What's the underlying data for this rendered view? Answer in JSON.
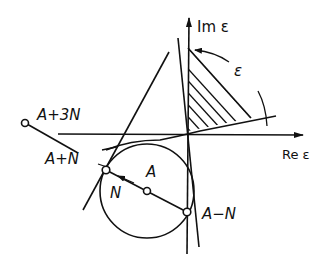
{
  "figure": {
    "axes": {
      "y_label": "Im ε",
      "x_label": "Re ε"
    },
    "points": {
      "center": "A",
      "plus_n": "A+N",
      "plus_3n": "A+3N",
      "minus_n": "A−N"
    },
    "vector_label": "N",
    "angle_label": "ε",
    "colors": {
      "ink": "#111111",
      "background": "#ffffff"
    }
  }
}
